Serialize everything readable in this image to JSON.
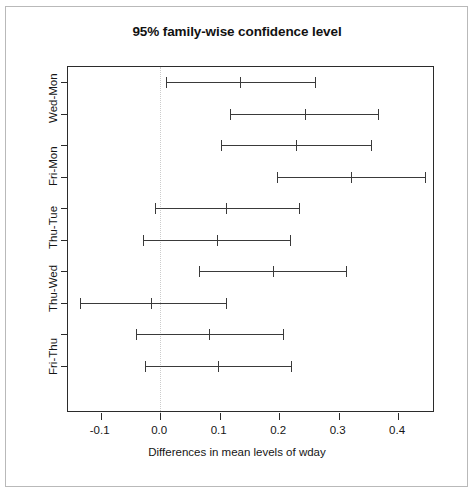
{
  "chart_data": {
    "type": "scatter",
    "title": "95% family-wise confidence level",
    "xlabel": "Differences in mean levels of wday",
    "ylabel": "",
    "xlim": [
      -0.155,
      0.462
    ],
    "xticks": [
      -0.1,
      0.0,
      0.1,
      0.2,
      0.3,
      0.4
    ],
    "xticklabels": [
      "-0.1",
      "0.0",
      "0.1",
      "0.2",
      "0.3",
      "0.4"
    ],
    "grid": false,
    "legend": null,
    "reference_line": {
      "x": 0.0,
      "style": "dotted",
      "color": "#cccccc"
    },
    "ylabels": [
      "Wed-Mon",
      "Fri-Mon",
      "Thu-Tue",
      "Thu-Wed",
      "Fri-Thu"
    ],
    "intervals": [
      {
        "label": "Wed-Mon",
        "lower": 0.01,
        "estimate": 0.135,
        "upper": 0.26
      },
      {
        "label": "",
        "lower": 0.118,
        "estimate": 0.243,
        "upper": 0.367
      },
      {
        "label": "Fri-Mon",
        "lower": 0.102,
        "estimate": 0.228,
        "upper": 0.355
      },
      {
        "label": "",
        "lower": 0.196,
        "estimate": 0.32,
        "upper": 0.445
      },
      {
        "label": "Thu-Tue",
        "lower": -0.009,
        "estimate": 0.111,
        "upper": 0.234
      },
      {
        "label": "",
        "lower": -0.029,
        "estimate": 0.096,
        "upper": 0.219
      },
      {
        "label": "Thu-Wed",
        "lower": 0.066,
        "estimate": 0.19,
        "upper": 0.312
      },
      {
        "label": "",
        "lower": -0.135,
        "estimate": -0.015,
        "upper": 0.11
      },
      {
        "label": "Fri-Thu",
        "lower": -0.04,
        "estimate": 0.082,
        "upper": 0.206
      },
      {
        "label": "",
        "lower": -0.025,
        "estimate": 0.097,
        "upper": 0.22
      }
    ]
  },
  "chart": {
    "title": "95% family-wise confidence level",
    "x_axis_title": "Differences in mean levels of wday",
    "x_tick_labels": [
      "-0.1",
      "0.0",
      "0.1",
      "0.2",
      "0.3",
      "0.4"
    ],
    "y_tick_labels": [
      "Wed-Mon",
      "Fri-Mon",
      "Thu-Tue",
      "Thu-Wed",
      "Fri-Thu"
    ]
  }
}
